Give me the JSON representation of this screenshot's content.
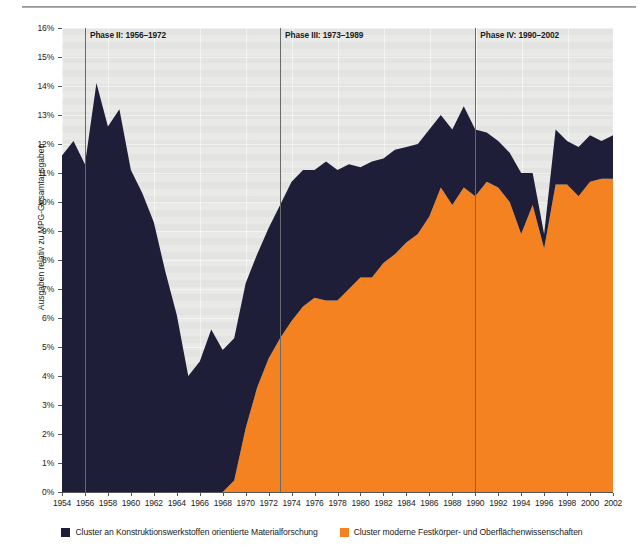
{
  "figure": {
    "y_axis_title": "Ausgaben relativ zu MPG-Gesamtausgaben",
    "colors": {
      "series_dark": "#1e1e38",
      "series_orange": "#f58220",
      "plot_background": "#e9eae7",
      "divider": "#6a6a6a"
    }
  },
  "phases": [
    {
      "label": "Phase II: 1956–1972",
      "at_year": 1956
    },
    {
      "label": "Phase III: 1973–1989",
      "at_year": 1973
    },
    {
      "label": "Phase IV: 1990–2002",
      "at_year": 1990
    }
  ],
  "legend": {
    "items": [
      {
        "color": "#1e1e38",
        "label": "Cluster an Konstruktionswerkstoffen orientierte Materialforschung"
      },
      {
        "color": "#f58220",
        "label": "Cluster moderne Festkörper- und Oberflächenwissenschaften"
      }
    ]
  },
  "chart_data": {
    "type": "area",
    "stacked": true,
    "title": "",
    "subtitle": "",
    "xlabel": "",
    "ylabel": "Ausgaben relativ zu MPG-Gesamtausgaben",
    "xlim": [
      1954,
      2002
    ],
    "ylim": [
      0,
      16
    ],
    "ytick_labels": [
      "0%",
      "1%",
      "2%",
      "3%",
      "4%",
      "5%",
      "6%",
      "7%",
      "8%",
      "9%",
      "10%",
      "11%",
      "12%",
      "13%",
      "14%",
      "15%",
      "16%"
    ],
    "ytick_values": [
      0,
      1,
      2,
      3,
      4,
      5,
      6,
      7,
      8,
      9,
      10,
      11,
      12,
      13,
      14,
      15,
      16
    ],
    "xtick_labels": [
      "1954",
      "1956",
      "1958",
      "1960",
      "1962",
      "1964",
      "1966",
      "1968",
      "1970",
      "1972",
      "1974",
      "1976",
      "1978",
      "1980",
      "1982",
      "1984",
      "1986",
      "1988",
      "1990",
      "1992",
      "1994",
      "1996",
      "1998",
      "2000",
      "2002"
    ],
    "xtick_values": [
      1954,
      1956,
      1958,
      1960,
      1962,
      1964,
      1966,
      1968,
      1970,
      1972,
      1974,
      1976,
      1978,
      1980,
      1982,
      1984,
      1986,
      1988,
      1990,
      1992,
      1994,
      1996,
      1998,
      2000,
      2002
    ],
    "grid": true,
    "legend_position": "bottom",
    "x": [
      1954,
      1955,
      1956,
      1957,
      1958,
      1959,
      1960,
      1961,
      1962,
      1963,
      1964,
      1965,
      1966,
      1967,
      1968,
      1969,
      1970,
      1971,
      1972,
      1973,
      1974,
      1975,
      1976,
      1977,
      1978,
      1979,
      1980,
      1981,
      1982,
      1983,
      1984,
      1985,
      1986,
      1987,
      1988,
      1989,
      1990,
      1991,
      1992,
      1993,
      1994,
      1995,
      1996,
      1997,
      1998,
      1999,
      2000,
      2001,
      2002
    ],
    "series": [
      {
        "name": "Cluster moderne Festkörper- und Oberflächenwissenschaften",
        "color": "#f58220",
        "values": [
          0,
          0,
          0,
          0,
          0,
          0,
          0,
          0,
          0,
          0,
          0,
          0,
          0,
          0,
          0,
          0.4,
          2.2,
          3.6,
          4.6,
          5.3,
          5.9,
          6.4,
          6.7,
          6.6,
          6.6,
          7.0,
          7.4,
          7.4,
          7.9,
          8.2,
          8.6,
          8.9,
          9.5,
          10.5,
          9.9,
          10.5,
          10.2,
          10.7,
          10.5,
          10.0,
          8.9,
          9.9,
          8.4,
          10.6,
          10.6,
          10.2,
          10.7,
          10.8,
          10.8
        ]
      },
      {
        "name": "Cluster an Konstruktionswerkstoffen orientierte Materialforschung",
        "color": "#1e1e38",
        "values": [
          11.6,
          12.1,
          11.3,
          14.1,
          12.6,
          13.2,
          11.1,
          10.3,
          9.3,
          7.6,
          6.1,
          4.0,
          4.5,
          5.6,
          4.9,
          4.9,
          5.0,
          4.6,
          4.5,
          4.6,
          4.8,
          4.7,
          4.4,
          4.8,
          4.5,
          4.3,
          3.8,
          4.0,
          3.6,
          3.6,
          3.3,
          3.1,
          3.0,
          2.5,
          2.6,
          2.8,
          2.3,
          1.7,
          1.6,
          1.7,
          2.1,
          1.1,
          0.5,
          1.9,
          1.5,
          1.7,
          1.6,
          1.3,
          1.5
        ]
      }
    ]
  }
}
